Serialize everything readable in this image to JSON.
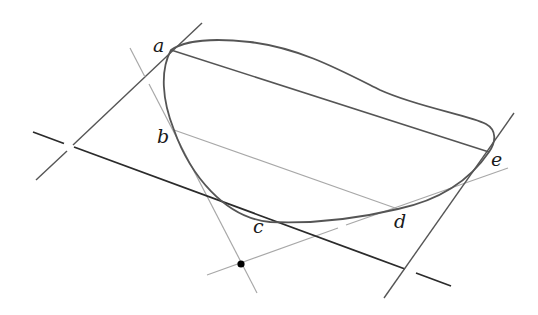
{
  "diagram": {
    "type": "geometry",
    "colors": {
      "background": "#ffffff",
      "curve": "#555555",
      "dark_line": "#2b2b2b",
      "medium_line": "#555555",
      "light_line": "#a8a8a8",
      "dot": "#000000"
    },
    "points": [
      {
        "id": "a",
        "label": "a",
        "x": 171,
        "y": 50,
        "label_x": 153,
        "label_y": 52
      },
      {
        "id": "b",
        "label": "b",
        "x": 174,
        "y": 130,
        "label_x": 157,
        "label_y": 143
      },
      {
        "id": "c",
        "label": "c",
        "x": 270,
        "y": 222,
        "label_x": 253,
        "label_y": 233
      },
      {
        "id": "d",
        "label": "d",
        "x": 398,
        "y": 209,
        "label_x": 394,
        "label_y": 228
      },
      {
        "id": "e",
        "label": "e",
        "x": 489,
        "y": 152,
        "label_x": 491,
        "label_y": 166
      }
    ],
    "labels": {
      "a": "a",
      "b": "b",
      "c": "c",
      "d": "d",
      "e": "e"
    },
    "lines": [
      {
        "id": "tangent-a",
        "from": [
          202,
          23
        ],
        "to": [
          36,
          180
        ],
        "shade": "medium"
      },
      {
        "id": "tangent-b",
        "from": [
          130,
          48
        ],
        "to": [
          257,
          293
        ],
        "shade": "light"
      },
      {
        "id": "tangent-c",
        "from": [
          33,
          132
        ],
        "to": [
          451,
          286
        ],
        "shade": "dark"
      },
      {
        "id": "tangent-d",
        "from": [
          207,
          275
        ],
        "to": [
          508,
          168
        ],
        "shade": "light"
      },
      {
        "id": "tangent-e",
        "from": [
          514,
          113
        ],
        "to": [
          384,
          298
        ],
        "shade": "medium"
      },
      {
        "id": "chord-ae",
        "from": [
          171,
          50
        ],
        "to": [
          489,
          152
        ],
        "shade": "medium"
      },
      {
        "id": "chord-bd",
        "from": [
          174,
          130
        ],
        "to": [
          398,
          209
        ],
        "shade": "light"
      }
    ],
    "marked_point": {
      "x": 241,
      "y": 264,
      "radius": 3.5
    }
  }
}
